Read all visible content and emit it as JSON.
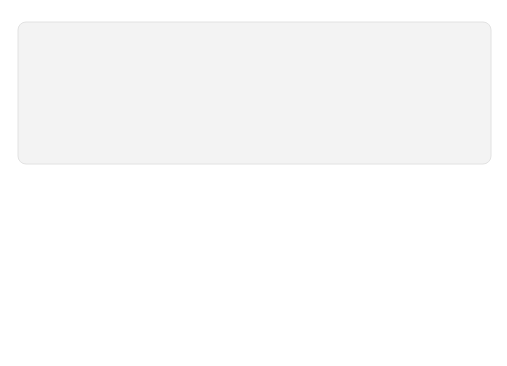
{
  "diagram": {
    "sections": {
      "light_reaction": "LIGHT REACTION",
      "calvin_cycle": "CALVIN CYCLE"
    },
    "inputs": {
      "light": "Light",
      "water": {
        "base": "H",
        "sub": "2",
        "tail": "O"
      },
      "co2": {
        "base": "CO",
        "sub": "2"
      }
    },
    "outputs": {
      "oxygen": {
        "base": "O",
        "sub": "2"
      }
    },
    "thylakoid": {
      "line1": "Photosystem II",
      "line2": "Electron transport chain",
      "line3": "Photosystem I"
    },
    "carriers": {
      "nadp": {
        "base": "NADP",
        "sup": "+"
      },
      "adp": "ADP",
      "pi": {
        "base": "+ P",
        "sub": "i"
      },
      "atp": "ATP",
      "nadph": "NADPH"
    },
    "calvin": {
      "rubp": "RuBP",
      "pga": "3-Phosphoglycerate",
      "g3p": "G3P"
    },
    "products": {
      "starch": {
        "line1": "Starch",
        "line2": "(storage)"
      },
      "amino": {
        "line1": "Amino acids",
        "line2": "Fatty acids"
      },
      "sucrose": {
        "line1": "Sucrose",
        "line2": "(export)"
      }
    },
    "organelle_label": "Chloroplast",
    "colors": {
      "panel_bg": "#f3f3f3",
      "stroma": "#dedede",
      "membrane_outer": "#333333",
      "membrane_inner": "#8c8c8c",
      "arrow_gray": "#b4b4b4",
      "disk": "#7e7e7e",
      "sun": "#777777",
      "text": "#222222"
    }
  }
}
